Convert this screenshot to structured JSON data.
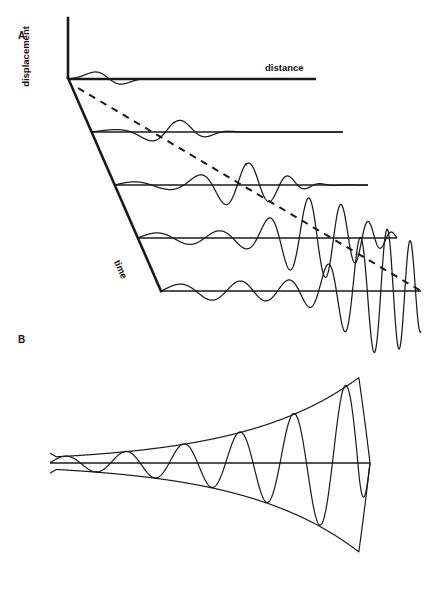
{
  "figure": {
    "title_hidden": "",
    "background": "#ffffff",
    "stroke": "#1a1a1a",
    "width": 439,
    "height": 593
  },
  "panels": [
    {
      "letter": "A",
      "letter_x": 18,
      "letter_y": 30,
      "description": "Perspective stack of seismogram-like traces showing a dispersive wave train; displacement vs distance, successive traces offset in time"
    },
    {
      "letter": "B",
      "letter_x": 18,
      "letter_y": 334,
      "description": "Single oscillation with exponentially growing amplitude bounded by upper and lower envelope curves"
    }
  ],
  "labels": {
    "displacement": "displacement",
    "distance": "distance",
    "time": "time"
  },
  "chart_data": {
    "type": "line",
    "title": "",
    "xlabel": "distance",
    "ylabel": "displacement",
    "zlabel": "time",
    "grid": false,
    "legend": "none",
    "panel_a": {
      "axis_vertical": {
        "x": 68,
        "y_top": 18,
        "y_bottom": 78,
        "label": "displacement"
      },
      "axis_time_diagonal": {
        "x1": 68,
        "y1": 78,
        "x2": 161,
        "y2": 291,
        "label": "time"
      },
      "axis_distance": {
        "label": "distance",
        "label_x": 265,
        "label_y": 62
      },
      "traces": [
        {
          "index": 1,
          "origin_x": 68,
          "baseline_y": 79,
          "end_x": 316,
          "amp": 9,
          "packet_center": 0.16,
          "packet_width": 0.13,
          "wavelength": 58,
          "tail_amp": 0.0
        },
        {
          "index": 2,
          "origin_x": 91,
          "baseline_y": 132,
          "end_x": 343,
          "amp": 12,
          "packet_center": 0.33,
          "packet_width": 0.2,
          "wavelength": 56,
          "tail_amp": 0.0
        },
        {
          "index": 3,
          "origin_x": 114,
          "baseline_y": 185,
          "end_x": 368,
          "amp": 22,
          "packet_center": 0.52,
          "packet_width": 0.26,
          "wavelength": 52,
          "tail_amp": 0.0
        },
        {
          "index": 4,
          "origin_x": 137,
          "baseline_y": 238,
          "end_x": 397,
          "amp": 40,
          "packet_center": 0.7,
          "packet_width": 0.3,
          "wavelength": 50,
          "tail_amp": 0.0
        },
        {
          "index": 5,
          "origin_x": 161,
          "baseline_y": 291,
          "end_x": 421,
          "amp": 62,
          "packet_center": 0.86,
          "packet_width": 0.32,
          "wavelength": 48,
          "tail_amp": 0.0
        }
      ],
      "dashed_line": {
        "x1": 78,
        "y1": 88,
        "x2": 421,
        "y2": 291,
        "style": "dashed",
        "meaning": "group-velocity / wave-packet arrival locus"
      }
    },
    "panel_b": {
      "baseline": {
        "x1": 50,
        "y1": 463,
        "x2": 370,
        "y2": 463
      },
      "envelope_upper": {
        "x_start": 50,
        "y_start": 456,
        "x_end": 370,
        "y_end": 463,
        "peak_y": 371
      },
      "envelope_lower": {
        "x_start": 50,
        "y_start": 470,
        "x_end": 370,
        "y_end": 463,
        "peak_y": 561
      },
      "oscillation": {
        "cycles": 5.5,
        "wavelength_start": 62,
        "wavelength_end": 50,
        "growth": "exponential",
        "amp_start": 6,
        "amp_end": 96
      }
    }
  }
}
